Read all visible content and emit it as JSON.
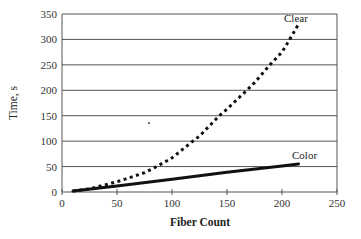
{
  "chart_data": {
    "type": "line",
    "title": "",
    "xlabel": "Fiber Count",
    "ylabel": "Time, s",
    "xlim": [
      0,
      250
    ],
    "ylim": [
      0,
      350
    ],
    "x_ticks": [
      0,
      50,
      100,
      150,
      200,
      250
    ],
    "y_ticks": [
      0,
      50,
      100,
      150,
      200,
      250,
      300,
      350
    ],
    "grid": {
      "horizontal": true,
      "vertical": false
    },
    "legend": "inline labels at line ends",
    "series": [
      {
        "name": "Clear",
        "style": "dotted",
        "color": "#111111",
        "points": [
          [
            10,
            2
          ],
          [
            25,
            6
          ],
          [
            50,
            20
          ],
          [
            75,
            38
          ],
          [
            86,
            50
          ],
          [
            100,
            67
          ],
          [
            119,
            100
          ],
          [
            125,
            110
          ],
          [
            143,
            150
          ],
          [
            150,
            163
          ],
          [
            168,
            200
          ],
          [
            175,
            215
          ],
          [
            189,
            250
          ],
          [
            200,
            275
          ],
          [
            207,
            300
          ],
          [
            215,
            330
          ]
        ]
      },
      {
        "name": "Color",
        "style": "solid",
        "color": "#111111",
        "points": [
          [
            10,
            2
          ],
          [
            50,
            12
          ],
          [
            100,
            25
          ],
          [
            150,
            39
          ],
          [
            200,
            51
          ],
          [
            215,
            55
          ]
        ]
      }
    ]
  },
  "labels": {
    "x_axis_title": "Fiber Count",
    "y_axis_title": "Time, s",
    "series_clear": "Clear",
    "series_color": "Color",
    "marker": "*"
  },
  "colors": {
    "gridline": "#555555",
    "axis": "#555555",
    "line": "#111111",
    "background": "#ffffff"
  }
}
